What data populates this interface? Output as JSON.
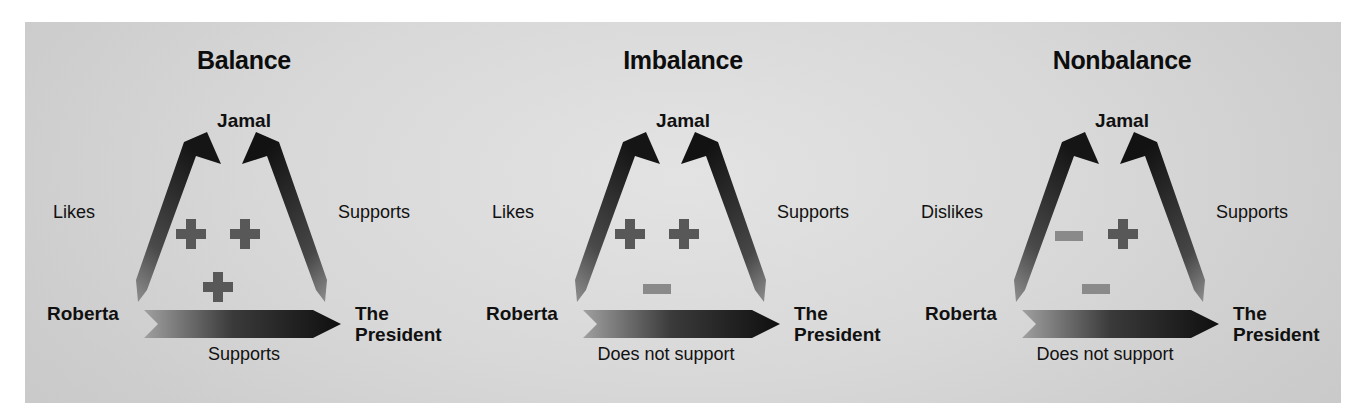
{
  "figure": {
    "background_color": "#d6d6d6",
    "page_color": "#ffffff"
  },
  "panels": [
    {
      "title": "Balance",
      "nodes": {
        "top": "Jamal",
        "left": "Roberta",
        "right_line1": "The",
        "right_line2": "President"
      },
      "edges": {
        "left": "Likes",
        "right": "Supports",
        "bottom": "Supports"
      },
      "signs": {
        "left": "+",
        "right": "+",
        "bottom": "+"
      }
    },
    {
      "title": "Imbalance",
      "nodes": {
        "top": "Jamal",
        "left": "Roberta",
        "right_line1": "The",
        "right_line2": "President"
      },
      "edges": {
        "left": "Likes",
        "right": "Supports",
        "bottom": "Does not support"
      },
      "signs": {
        "left": "+",
        "right": "+",
        "bottom": "-"
      }
    },
    {
      "title": "Nonbalance",
      "nodes": {
        "top": "Jamal",
        "left": "Roberta",
        "right_line1": "The",
        "right_line2": "President"
      },
      "edges": {
        "left": "Dislikes",
        "right": "Supports",
        "bottom": "Does not support"
      },
      "signs": {
        "left": "-",
        "right": "+",
        "bottom": "-"
      }
    }
  ],
  "colors": {
    "arrow_dark": "#1b1b1b",
    "arrow_light": "#9a9a9a",
    "plus_sign": "#585858",
    "minus_sign": "#8a8a8a",
    "text": "#101010"
  }
}
